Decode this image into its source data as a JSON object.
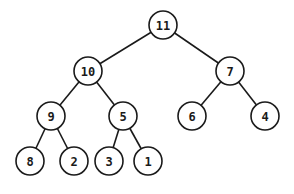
{
  "diagram": {
    "type": "binary-tree",
    "radius": 14,
    "nodes": [
      {
        "id": "n11",
        "label": "11",
        "x": 163,
        "y": 25
      },
      {
        "id": "n10",
        "label": "10",
        "x": 88,
        "y": 71
      },
      {
        "id": "n7",
        "label": "7",
        "x": 230,
        "y": 71
      },
      {
        "id": "n9",
        "label": "9",
        "x": 51,
        "y": 116
      },
      {
        "id": "n5",
        "label": "5",
        "x": 123,
        "y": 116
      },
      {
        "id": "n6",
        "label": "6",
        "x": 192,
        "y": 116
      },
      {
        "id": "n4",
        "label": "4",
        "x": 265,
        "y": 116
      },
      {
        "id": "n8",
        "label": "8",
        "x": 30,
        "y": 161
      },
      {
        "id": "n2",
        "label": "2",
        "x": 74,
        "y": 161
      },
      {
        "id": "n3",
        "label": "3",
        "x": 109,
        "y": 161
      },
      {
        "id": "n1",
        "label": "1",
        "x": 148,
        "y": 161
      }
    ],
    "edges": [
      [
        "n11",
        "n10"
      ],
      [
        "n11",
        "n7"
      ],
      [
        "n10",
        "n9"
      ],
      [
        "n10",
        "n5"
      ],
      [
        "n7",
        "n6"
      ],
      [
        "n7",
        "n4"
      ],
      [
        "n9",
        "n8"
      ],
      [
        "n9",
        "n2"
      ],
      [
        "n5",
        "n3"
      ],
      [
        "n5",
        "n1"
      ]
    ]
  }
}
